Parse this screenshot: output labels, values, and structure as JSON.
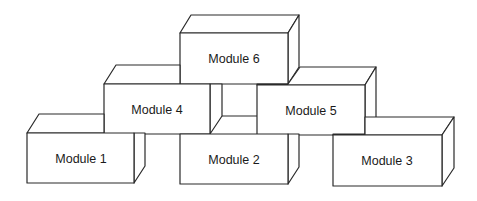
{
  "diagram": {
    "type": "stacked-blocks",
    "stroke_color": "#2a2a2a",
    "fill_color": "#ffffff",
    "modules": [
      {
        "id": "m1",
        "label": "Module 1",
        "row": "bottom",
        "position": "left"
      },
      {
        "id": "m2",
        "label": "Module 2",
        "row": "bottom",
        "position": "center"
      },
      {
        "id": "m3",
        "label": "Module 3",
        "row": "bottom",
        "position": "right"
      },
      {
        "id": "m4",
        "label": "Module 4",
        "row": "middle",
        "position": "left"
      },
      {
        "id": "m5",
        "label": "Module 5",
        "row": "middle",
        "position": "right"
      },
      {
        "id": "m6",
        "label": "Module 6",
        "row": "top",
        "position": "center"
      }
    ]
  }
}
